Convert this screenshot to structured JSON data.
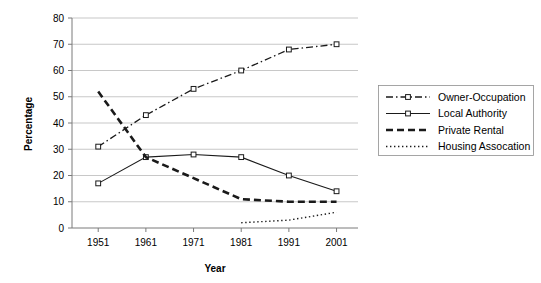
{
  "chart_data": {
    "type": "line",
    "title": "",
    "xlabel": "Year",
    "ylabel": "Percentage",
    "categories": [
      "1951",
      "1961",
      "1971",
      "1981",
      "1991",
      "2001"
    ],
    "x": [
      1951,
      1961,
      1971,
      1981,
      1991,
      2001
    ],
    "xlim": [
      1946,
      2006
    ],
    "ylim": [
      0,
      80
    ],
    "yticks": [
      "0",
      "10",
      "20",
      "30",
      "40",
      "50",
      "60",
      "70",
      "80"
    ],
    "ytick_values": [
      0,
      10,
      20,
      30,
      40,
      50,
      60,
      70,
      80
    ],
    "grid": true,
    "legend_position": "right",
    "series": [
      {
        "name": "Owner-Occupation",
        "style": "dash-dot",
        "marker": "square",
        "values": [
          31,
          43,
          53,
          60,
          68,
          70
        ]
      },
      {
        "name": "Local Authority",
        "style": "solid",
        "marker": "square",
        "values": [
          17,
          27,
          28,
          27,
          20,
          14
        ]
      },
      {
        "name": "Private Rental",
        "style": "dashed",
        "marker": "none",
        "values": [
          52,
          27,
          19,
          11,
          10,
          10
        ]
      },
      {
        "name": "Housing Assocation",
        "style": "dotted",
        "marker": "none",
        "values": [
          null,
          null,
          null,
          2,
          3,
          6
        ]
      }
    ]
  },
  "axis": {
    "y_title": "Percentage",
    "x_title": "Year"
  },
  "legend": {
    "entries": [
      {
        "label": "Owner-Occupation"
      },
      {
        "label": "Local Authority"
      },
      {
        "label": "Private Rental"
      },
      {
        "label": "Housing Assocation"
      }
    ]
  }
}
